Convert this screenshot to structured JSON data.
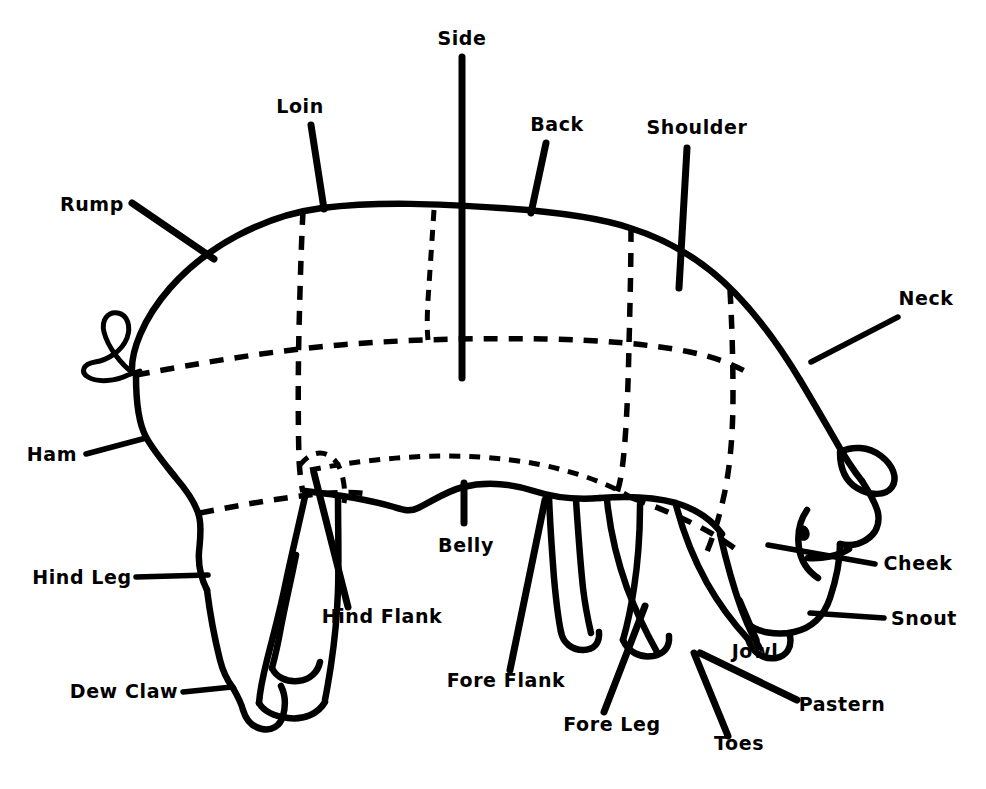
{
  "diagram": {
    "style": "hand-drawn line art, black on white",
    "colors": {
      "ink": "#000000",
      "background": "#ffffff"
    },
    "canvas": {
      "width": 986,
      "height": 789
    }
  },
  "labels": [
    {
      "id": "side",
      "text": "Side",
      "x": 462,
      "y": 45,
      "anchor": "middle"
    },
    {
      "id": "loin",
      "text": "Loin",
      "x": 300,
      "y": 113,
      "anchor": "middle"
    },
    {
      "id": "back",
      "text": "Back",
      "x": 557,
      "y": 131,
      "anchor": "middle"
    },
    {
      "id": "shoulder",
      "text": "Shoulder",
      "x": 697,
      "y": 134,
      "anchor": "middle"
    },
    {
      "id": "rump",
      "text": "Rump",
      "x": 92,
      "y": 211,
      "anchor": "middle"
    },
    {
      "id": "neck",
      "text": "Neck",
      "x": 926,
      "y": 305,
      "anchor": "middle"
    },
    {
      "id": "ham",
      "text": "Ham",
      "x": 52,
      "y": 461,
      "anchor": "middle"
    },
    {
      "id": "belly",
      "text": "Belly",
      "x": 466,
      "y": 552,
      "anchor": "middle"
    },
    {
      "id": "cheek",
      "text": "Cheek",
      "x": 918,
      "y": 570,
      "anchor": "middle"
    },
    {
      "id": "hind-leg",
      "text": "Hind Leg",
      "x": 82,
      "y": 584,
      "anchor": "middle"
    },
    {
      "id": "snout",
      "text": "Snout",
      "x": 924,
      "y": 625,
      "anchor": "middle"
    },
    {
      "id": "hind-flank",
      "text": "Hind Flank",
      "x": 382,
      "y": 623,
      "anchor": "middle"
    },
    {
      "id": "jowl",
      "text": "Jowl",
      "x": 755,
      "y": 658,
      "anchor": "middle"
    },
    {
      "id": "fore-flank",
      "text": "Fore Flank",
      "x": 506,
      "y": 687,
      "anchor": "middle"
    },
    {
      "id": "dew-claw",
      "text": "Dew Claw",
      "x": 124,
      "y": 698,
      "anchor": "middle"
    },
    {
      "id": "pastern",
      "text": "Pastern",
      "x": 842,
      "y": 711,
      "anchor": "middle"
    },
    {
      "id": "fore-leg",
      "text": "Fore Leg",
      "x": 612,
      "y": 731,
      "anchor": "middle"
    },
    {
      "id": "toes",
      "text": "Toes",
      "x": 739,
      "y": 750,
      "anchor": "middle"
    }
  ],
  "parts_list": [
    "Side",
    "Loin",
    "Back",
    "Shoulder",
    "Rump",
    "Neck",
    "Ham",
    "Belly",
    "Cheek",
    "Hind Leg",
    "Snout",
    "Hind Flank",
    "Jowl",
    "Fore Flank",
    "Dew Claw",
    "Pastern",
    "Fore Leg",
    "Toes"
  ]
}
